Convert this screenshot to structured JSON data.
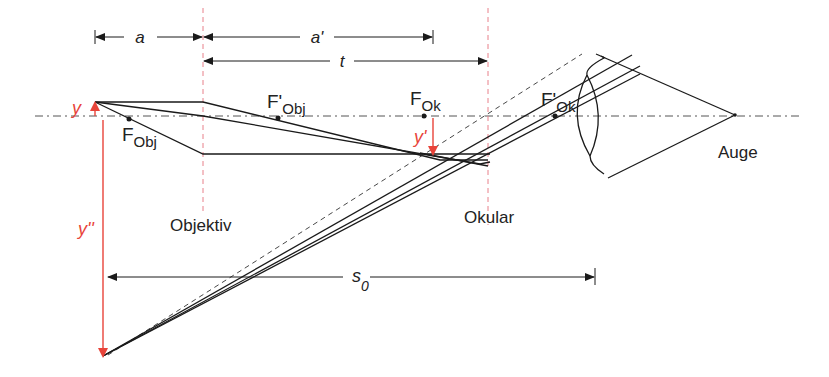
{
  "diagram": {
    "type": "telescope ray diagram (Kepler telescope / microscope)",
    "colors": {
      "lines": "#1a1a1a",
      "lens_planes": "#e8808a",
      "arrows_red": "#e8443a",
      "axis": "#555555"
    },
    "dimensions": {
      "a": "a",
      "a_prime": "a'",
      "t": "t",
      "s0": "s",
      "s0_sub": "0"
    },
    "focal_points": {
      "f_obj": {
        "main": "F",
        "sub": "Obj"
      },
      "f_obj_prime": {
        "main": "F'",
        "sub": "Obj"
      },
      "f_ok": {
        "main": "F",
        "sub": "Ok"
      },
      "f_ok_prime": {
        "main": "F'",
        "sub": "Ok"
      }
    },
    "image_labels": {
      "y": "y",
      "y_prime": "y'",
      "y_double_prime": "y''"
    },
    "component_labels": {
      "objective": "Objektiv",
      "eyepiece": "Okular",
      "eye": "Auge"
    }
  }
}
